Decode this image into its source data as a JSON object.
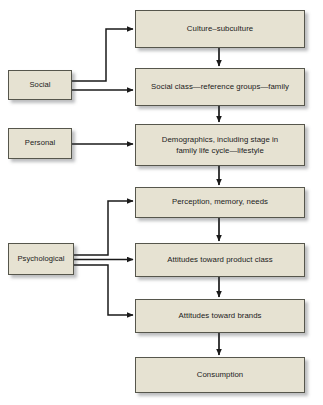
{
  "diagram": {
    "type": "flowchart",
    "colors": {
      "node_fill": "#e6e2d2",
      "node_border": "#56564c",
      "connector": "#1a1a1a",
      "text": "#1b1b1b",
      "background": "#ffffff",
      "shadow": "rgba(60,62,66,0.34)"
    },
    "influence_nodes": [
      {
        "id": "social",
        "label": "Social"
      },
      {
        "id": "personal",
        "label": "Personal"
      },
      {
        "id": "psychological",
        "label": "Psychological"
      }
    ],
    "process_nodes": [
      {
        "id": "culture",
        "label": "Culture–subculture"
      },
      {
        "id": "social-class",
        "label": "Social class—reference groups—family"
      },
      {
        "id": "demographics",
        "line1": "Demographics, including stage in",
        "line2": "family life cycle—lifestyle"
      },
      {
        "id": "perception",
        "label": "Perception, memory, needs"
      },
      {
        "id": "attitudes-product",
        "label": "Attitudes toward product class"
      },
      {
        "id": "attitudes-brands",
        "label": "Attitudes toward brands"
      },
      {
        "id": "consumption",
        "label": "Consumption"
      }
    ],
    "connections": [
      {
        "from": "social",
        "to": "culture",
        "style": "elbow-up"
      },
      {
        "from": "social",
        "to": "social-class",
        "style": "straight"
      },
      {
        "from": "personal",
        "to": "demographics",
        "style": "straight"
      },
      {
        "from": "psychological",
        "to": "perception",
        "style": "elbow-up"
      },
      {
        "from": "psychological",
        "to": "attitudes-product",
        "style": "straight"
      },
      {
        "from": "psychological",
        "to": "attitudes-brands",
        "style": "elbow-down"
      },
      {
        "from": "culture",
        "to": "social-class",
        "style": "vertical"
      },
      {
        "from": "social-class",
        "to": "demographics",
        "style": "vertical"
      },
      {
        "from": "demographics",
        "to": "perception",
        "style": "vertical"
      },
      {
        "from": "perception",
        "to": "attitudes-product",
        "style": "vertical"
      },
      {
        "from": "attitudes-product",
        "to": "attitudes-brands",
        "style": "vertical"
      },
      {
        "from": "attitudes-brands",
        "to": "consumption",
        "style": "vertical"
      }
    ]
  }
}
